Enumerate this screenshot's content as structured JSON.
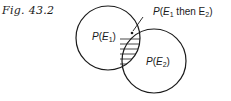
{
  "figure": {
    "label": "Fig. 43.2",
    "type": "venn-diagram",
    "sets": [
      {
        "name": "E1",
        "label": "P(E₁)",
        "cx": 108,
        "cy": 38,
        "r": 32
      },
      {
        "name": "E2",
        "label": "P(E₂)",
        "cx": 154,
        "cy": 61,
        "r": 32
      }
    ],
    "intersection": {
      "label": "P(E₁ then E₂)",
      "fill": "hatched"
    },
    "colors": {
      "stroke": "#1a1a1a",
      "background": "#ffffff"
    }
  }
}
